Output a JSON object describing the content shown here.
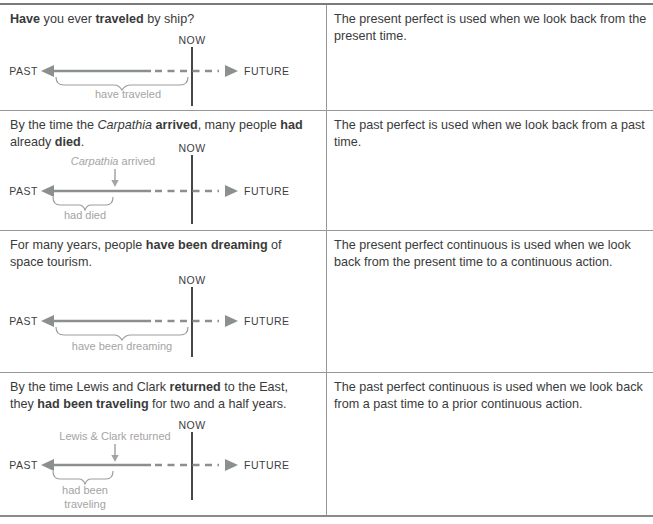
{
  "colors": {
    "text": "#3a3a3a",
    "muted_label": "#a4a4a4",
    "arrow": "#8c8f90",
    "now_line": "#464646",
    "border": "#979797"
  },
  "table": {
    "rows": [
      {
        "sentence": [
          {
            "text": "Have",
            "style": "bold"
          },
          {
            "text": " you ever ",
            "style": "normal"
          },
          {
            "text": "traveled",
            "style": "bold"
          },
          {
            "text": " by ship?",
            "style": "normal"
          }
        ],
        "explanation": "The present perfect is used when we look back from the present time.",
        "timeline": {
          "type": "span-to-now",
          "now_label": "NOW",
          "past_label": "PAST",
          "future_label": "FUTURE",
          "brace_label": "have traveled"
        }
      },
      {
        "sentence": [
          {
            "text": "By the time the ",
            "style": "normal"
          },
          {
            "text": "Carpathia",
            "style": "italic"
          },
          {
            "text": " ",
            "style": "normal"
          },
          {
            "text": "arrived",
            "style": "bold"
          },
          {
            "text": ", many people ",
            "style": "normal"
          },
          {
            "text": "had",
            "style": "bold"
          },
          {
            "text": " already ",
            "style": "normal"
          },
          {
            "text": "died",
            "style": "bold"
          },
          {
            "text": ".",
            "style": "normal"
          }
        ],
        "explanation": "The past perfect is used when we look back from a past time.",
        "timeline": {
          "type": "span-to-past-event",
          "now_label": "NOW",
          "past_label": "PAST",
          "future_label": "FUTURE",
          "event_label_italic": "Carpathia",
          "event_label_rest": " arrived",
          "brace_label": "had died"
        }
      },
      {
        "sentence": [
          {
            "text": "For many years, people ",
            "style": "normal"
          },
          {
            "text": "have been dreaming",
            "style": "bold"
          },
          {
            "text": " of space tourism.",
            "style": "normal"
          }
        ],
        "explanation": "The present perfect continuous is used when we look back from the present time to a continuous action.",
        "timeline": {
          "type": "span-to-now",
          "now_label": "NOW",
          "past_label": "PAST",
          "future_label": "FUTURE",
          "brace_label": "have been dreaming"
        }
      },
      {
        "sentence": [
          {
            "text": "By the time Lewis and Clark ",
            "style": "normal"
          },
          {
            "text": "returned",
            "style": "bold"
          },
          {
            "text": " to the East, they ",
            "style": "normal"
          },
          {
            "text": "had been traveling",
            "style": "bold"
          },
          {
            "text": " for two and a half years.",
            "style": "normal"
          }
        ],
        "explanation": "The past perfect continuous is used when we look back from a past time to a prior continuous action.",
        "timeline": {
          "type": "span-to-past-event",
          "now_label": "NOW",
          "past_label": "PAST",
          "future_label": "FUTURE",
          "event_label": "Lewis & Clark returned",
          "brace_label_line1": "had been",
          "brace_label_line2": "traveling"
        }
      }
    ]
  }
}
